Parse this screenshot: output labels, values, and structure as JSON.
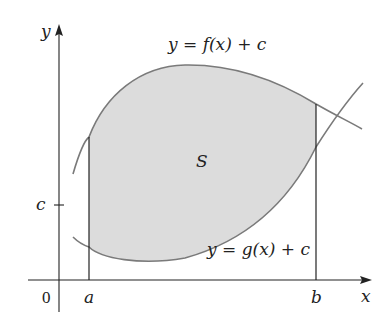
{
  "diagram": {
    "axis_labels": {
      "x": "x",
      "y": "y",
      "origin": "0"
    },
    "tick_labels": {
      "a": "a",
      "b": "b",
      "c": "c"
    },
    "region_label": "S",
    "curves": [
      {
        "name": "upper",
        "label": "y = f(x) + c"
      },
      {
        "name": "lower",
        "label": "y = g(x) + c"
      }
    ],
    "colors": {
      "axis": "#222222",
      "curve": "#7a7a7a",
      "region_fill": "#dcdcdc",
      "text": "#222222"
    }
  }
}
